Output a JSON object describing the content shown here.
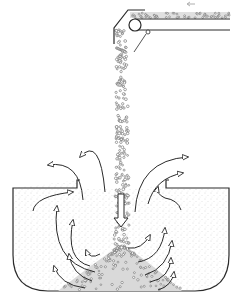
{
  "diagram": {
    "colors": {
      "line": "#2a2a2a",
      "fill_dust": "#e6e6e6",
      "particle": "#6a6a6a",
      "background": "#ffffff"
    },
    "components": [
      {
        "id": "conveyor",
        "label": "Belt conveyor with head pulley"
      },
      {
        "id": "direction-arrow",
        "label": "Conveyor direction (leftward)"
      },
      {
        "id": "falling-stream",
        "label": "Falling bulk material stream"
      },
      {
        "id": "tank",
        "label": "Receiving tank / hopper"
      },
      {
        "id": "pile",
        "label": "Material pile"
      },
      {
        "id": "air-flow-arrows",
        "label": "Displaced air / dust flow arrows"
      }
    ]
  }
}
